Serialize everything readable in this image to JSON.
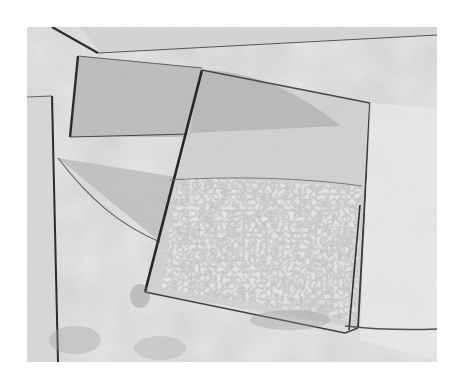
{
  "image": {
    "description": "Black-and-white photograph of overlapping glass panes lying on a textured concrete surface",
    "palette": {
      "background": "#ffffff",
      "surface": "#e4e4e4",
      "surface_dark": "#c8c8c8",
      "glass_tint": "#b9b9b9",
      "edge": "#1e1e1e"
    }
  }
}
